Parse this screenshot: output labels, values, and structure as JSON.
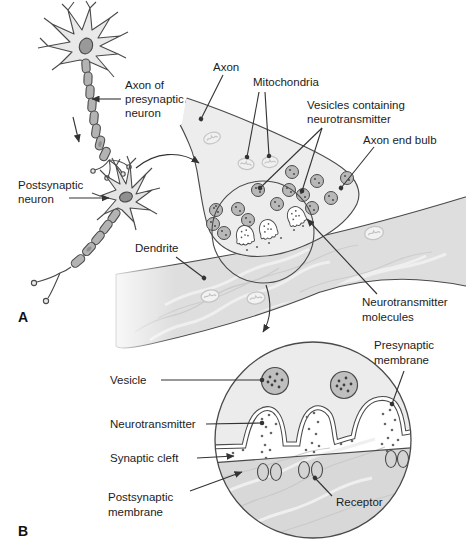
{
  "figure": {
    "panel_a_label": "A",
    "panel_b_label": "B"
  },
  "labels": {
    "axon_of_presynaptic_neuron": [
      "Axon of",
      "presynaptic",
      "neuron"
    ],
    "axon": "Axon",
    "mitochondria": "Mitochondria",
    "vesicles_containing_neurotransmitter": [
      "Vesicles containing",
      "neurotransmitter"
    ],
    "axon_end_bulb": "Axon end bulb",
    "postsynaptic_neuron": [
      "Postsynaptic",
      "neuron"
    ],
    "dendrite": "Dendrite",
    "neurotransmitter_molecules": [
      "Neurotransmitter",
      "molecules"
    ],
    "vesicle": "Vesicle",
    "presynaptic_membrane": [
      "Presynaptic",
      "membrane"
    ],
    "neurotransmitter": "Neurotransmitter",
    "synaptic_cleft": "Synaptic cleft",
    "postsynaptic_membrane": [
      "Postsynaptic",
      "membrane"
    ],
    "receptor": "Receptor"
  },
  "colors": {
    "line": "#4a4a4a",
    "label_text": "#1c1c1c",
    "cytoplasm_fill": "#ededed",
    "dendrite_fill": "#dedede",
    "postsynaptic_fill": "#d8d8d8",
    "myelin_fill": "#b3b3b3",
    "vesicle_fill": "#b8b8b8",
    "nucleus_fill": "#8f8f8f",
    "mitochondria_line": "#c4c4c4",
    "synaptic_cleft_fill": "#ffffff"
  }
}
